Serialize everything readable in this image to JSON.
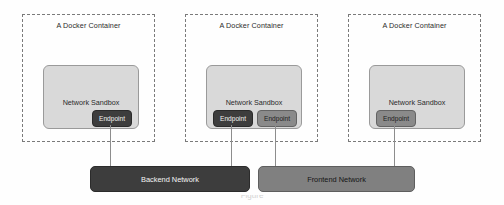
{
  "diagram": {
    "background_color": "#fefefe",
    "containers": [
      {
        "label": "A Docker Container",
        "sandbox_label": "Network Sandbox",
        "endpoints": [
          {
            "label": "Endpoint",
            "style": "dark",
            "connects_to": "Backend Network"
          }
        ]
      },
      {
        "label": "A Docker Container",
        "sandbox_label": "Network Sandbox",
        "endpoints": [
          {
            "label": "Endpoint",
            "style": "dark",
            "connects_to": "Backend Network"
          },
          {
            "label": "Endpoint",
            "style": "light",
            "connects_to": "Frontend Network"
          }
        ]
      },
      {
        "label": "A Docker Container",
        "sandbox_label": "Network Sandbox",
        "endpoints": [
          {
            "label": "Endpoint",
            "style": "light",
            "connects_to": "Frontend Network"
          }
        ]
      }
    ],
    "networks": [
      {
        "label": "Backend Network",
        "style": "backend",
        "color": "#3d3d3d"
      },
      {
        "label": "Frontend Network",
        "style": "frontend",
        "color": "#808080"
      }
    ],
    "caption_partial": "Figure"
  }
}
